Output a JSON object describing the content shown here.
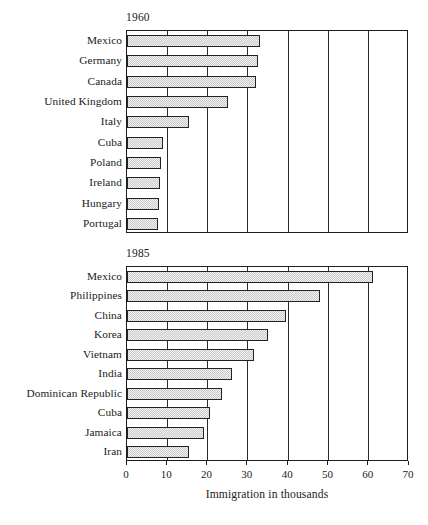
{
  "figure": {
    "width": 428,
    "height": 525,
    "background": "#ffffff",
    "bar_fill": "#e4e4e4",
    "bar_edge": "#232323",
    "axis_color": "#1d1d1d"
  },
  "chart_data": [
    {
      "type": "bar",
      "orientation": "horizontal",
      "title": "1960",
      "xlabel": "",
      "ylabel": "",
      "xlim": [
        0,
        70
      ],
      "xticks": [
        0,
        10,
        20,
        30,
        40,
        50,
        60,
        70
      ],
      "xticklabels": [
        "0",
        "10",
        "20",
        "30",
        "40",
        "50",
        "60",
        "70"
      ],
      "grid": "vertical",
      "legend": "none",
      "categories": [
        "Mexico",
        "Germany",
        "Canada",
        "United Kingdom",
        "Italy",
        "Cuba",
        "Poland",
        "Ireland",
        "Hungary",
        "Portugal"
      ],
      "values": [
        33.0,
        32.5,
        32.0,
        25.0,
        15.5,
        9.0,
        8.5,
        8.3,
        8.0,
        7.6
      ],
      "units": "thousands"
    },
    {
      "type": "bar",
      "orientation": "horizontal",
      "title": "1985",
      "xlabel": "Immigration in thousands",
      "ylabel": "",
      "xlim": [
        0,
        70
      ],
      "xticks": [
        0,
        10,
        20,
        30,
        40,
        50,
        60,
        70
      ],
      "xticklabels": [
        "0",
        "10",
        "20",
        "30",
        "40",
        "50",
        "60",
        "70"
      ],
      "grid": "vertical",
      "legend": "none",
      "categories": [
        "Mexico",
        "Philippines",
        "China",
        "Korea",
        "Vietnam",
        "India",
        "Dominican Republic",
        "Cuba",
        "Jamaica",
        "Iran"
      ],
      "values": [
        61.0,
        48.0,
        39.5,
        35.0,
        31.5,
        26.0,
        23.5,
        20.5,
        19.0,
        15.5
      ],
      "units": "thousands"
    }
  ]
}
